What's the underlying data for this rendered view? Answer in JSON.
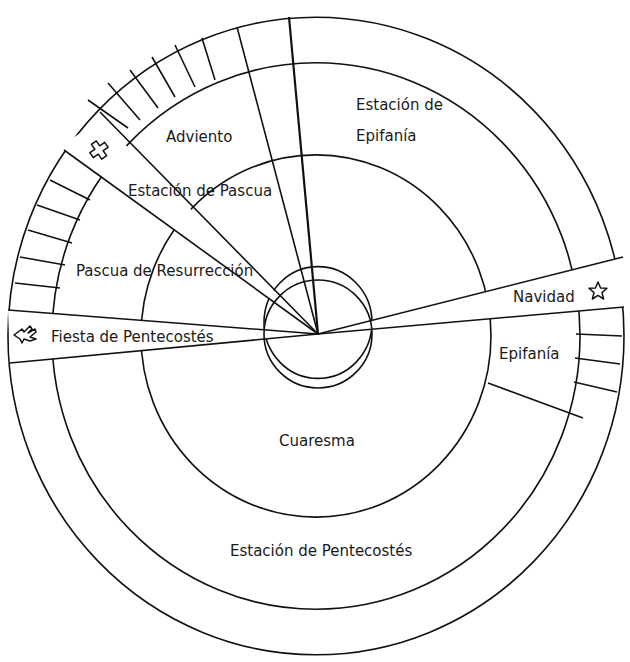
{
  "diagram": {
    "type": "liturgical-year-wheel",
    "labels": {
      "adviento": "Adviento",
      "estacion_epifania_line1": "Estación de",
      "estacion_epifania_line2": "Epifanía",
      "estacion_pascua": "Estación de Pascua",
      "pascua_resurreccion": "Pascua de Resurrección",
      "navidad": "Navidad",
      "fiesta_pentecostes": "Fiesta de Pentecostés",
      "epifania": "Epifanía",
      "cuaresma": "Cuaresma",
      "estacion_pentecostes": "Estación de Pentecostés"
    },
    "icons": {
      "navidad": "star-icon",
      "pascua": "cross-icon",
      "pentecostes": "dove-icon"
    },
    "colors": {
      "line": "#111111",
      "background": "#ffffff",
      "text": "#1a1a1a"
    }
  }
}
